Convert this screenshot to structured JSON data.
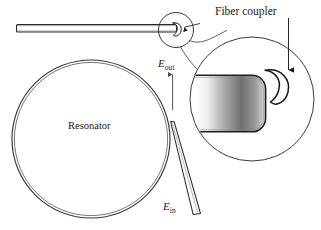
{
  "figure": {
    "type": "optical-microresonator-schematic",
    "background_color": "#ffffff",
    "line_color": "#1a1a1a",
    "labels": {
      "fiber_coupler": "Fiber coupler",
      "resonator": "Resonator",
      "e_out_symbol": "E",
      "e_out_subscript": "out",
      "e_in_symbol": "E",
      "e_in_subscript": "in"
    },
    "components": {
      "waveguide": {
        "name": "horizontal-waveguide",
        "x1": 16,
        "y1": 28,
        "x2": 176,
        "y2": 28,
        "thickness": 7
      },
      "resonator_circle": {
        "name": "resonator-ring",
        "cx": 91,
        "cy": 139,
        "r_outer": 79,
        "r_inner": 77
      },
      "tapered_fiber": {
        "name": "tapered-fiber",
        "tip_x": 171,
        "tip_y": 122,
        "base_x": 198,
        "base_y": 215,
        "tip_width": 3,
        "base_width": 7
      },
      "callout_small_circle": {
        "name": "callout-source-circle",
        "cx": 176,
        "cy": 30,
        "r": 17
      },
      "magnified_circle": {
        "name": "magnified-inset-circle",
        "cx": 252,
        "cy": 99,
        "r": 62
      },
      "magnified_resonator_edge": {
        "name": "magnified-resonator-edge",
        "shape": "rounded-rectangle",
        "gradient_from": "#f2f2f2",
        "gradient_mid": "#5a5a5a",
        "gradient_to": "#d8d8d8"
      },
      "fiber_coupler_crescent": {
        "name": "fiber-coupler-crescent",
        "cx": 279,
        "cy": 78
      },
      "arrow_e_out": {
        "name": "e-out-arrow",
        "x": 173,
        "y_start": 110,
        "y_end": 73,
        "direction": "up"
      },
      "arrow_fiber_coupler": {
        "name": "fiber-coupler-arrow",
        "direction": "down"
      },
      "arrow_small_coupler": {
        "name": "small-coupler-arrow",
        "direction": "left"
      }
    }
  }
}
